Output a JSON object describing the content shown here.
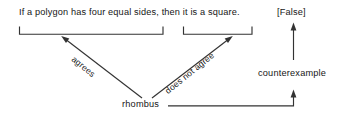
{
  "diagram": {
    "type": "logic-counterexample-diagram",
    "statement": "If a polygon has four equal sides, then it is a square.",
    "verdict": "[False]",
    "hypothesis_label": "agrees",
    "conclusion_label": "does not agree",
    "example": "rhombus",
    "relation": "counterexample",
    "ink_color": "#333333",
    "text_color": "#161616",
    "background": "#ffffff",
    "brackets": [
      {
        "name": "hypothesis-bracket",
        "spans": "If a polygon has four equal sides"
      },
      {
        "name": "conclusion-bracket",
        "spans": "it is a square"
      }
    ],
    "arrows": [
      {
        "name": "agrees-arrow",
        "from": "rhombus",
        "to": "hypothesis-bracket"
      },
      {
        "name": "does-not-agree-arrow",
        "from": "rhombus",
        "to": "conclusion-bracket"
      },
      {
        "name": "counterexample-arrow-upper",
        "from": "counterexample",
        "to": "verdict"
      },
      {
        "name": "counterexample-arrow-lower",
        "from": "rhombus",
        "to": "counterexample"
      }
    ]
  }
}
